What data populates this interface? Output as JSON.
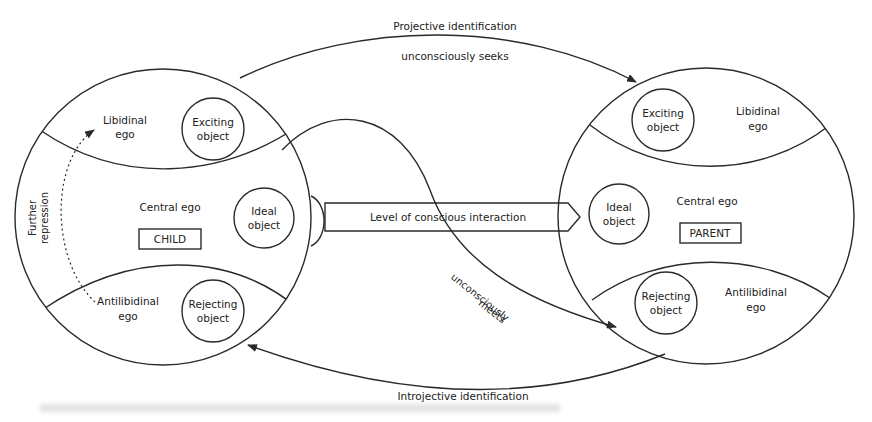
{
  "diagram": {
    "type": "object-relations-schema",
    "child": {
      "box_label": "CHILD",
      "central_ego": "Central ego",
      "libidinal_ego": [
        "Libidinal",
        "ego"
      ],
      "antilibidinal_ego": [
        "Antilibidinal",
        "ego"
      ],
      "exciting_object": [
        "Exciting",
        "object"
      ],
      "ideal_object": [
        "Ideal",
        "object"
      ],
      "rejecting_object": [
        "Rejecting",
        "object"
      ],
      "further_repression": [
        "Further",
        "repression"
      ]
    },
    "parent": {
      "box_label": "PARENT",
      "central_ego": "Central ego",
      "libidinal_ego": [
        "Libidinal",
        "ego"
      ],
      "antilibidinal_ego": [
        "Antilibidinal",
        "ego"
      ],
      "exciting_object": [
        "Exciting",
        "object"
      ],
      "ideal_object": [
        "Ideal",
        "object"
      ],
      "rejecting_object": [
        "Rejecting",
        "object"
      ]
    },
    "connections": {
      "projective_identification": "Projective identification",
      "unconsciously_seeks": "unconsciously seeks",
      "level_of_conscious_interaction": "Level of conscious interaction",
      "unconsciously_meets": [
        "unconsciously",
        "meets"
      ],
      "introjective_identification": "Introjective identification"
    },
    "colors": {
      "line": "#2a2a2a",
      "text": "#222222",
      "background": "#ffffff"
    }
  }
}
